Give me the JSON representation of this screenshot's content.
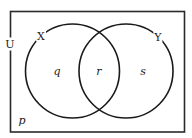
{
  "diagram": {
    "type": "venn",
    "universe": {
      "label": "U"
    },
    "sets": [
      {
        "id": "X",
        "label": "X"
      },
      {
        "id": "Y",
        "label": "Y"
      }
    ],
    "regions": {
      "outside": {
        "label": "p",
        "description": "in U but not in X or Y"
      },
      "x_only": {
        "label": "q",
        "description": "in X only"
      },
      "intersection": {
        "label": "r",
        "description": "in X and Y"
      },
      "y_only": {
        "label": "s",
        "description": "in Y only"
      }
    },
    "colors": {
      "stroke": "#1a1a1a",
      "background": "#ffffff"
    }
  }
}
